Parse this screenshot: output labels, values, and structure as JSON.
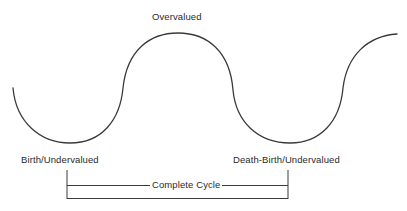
{
  "diagram": {
    "type": "cycle-curve",
    "colors": {
      "stroke": "#3a3a3a",
      "text": "#2a2a2a",
      "background": "#ffffff"
    },
    "labels": {
      "peak": "Overvalued",
      "start_trough": "Birth/Undervalued",
      "end_trough": "Death-Birth/Undervalued",
      "span": "Complete Cycle"
    },
    "curve_points": [
      {
        "x": 13,
        "y": 88,
        "role": "start"
      },
      {
        "x": 70,
        "y": 143,
        "role": "trough"
      },
      {
        "x": 123,
        "y": 88,
        "role": "inflection"
      },
      {
        "x": 178,
        "y": 33,
        "role": "peak"
      },
      {
        "x": 233,
        "y": 90,
        "role": "inflection"
      },
      {
        "x": 290,
        "y": 143,
        "role": "trough"
      },
      {
        "x": 343,
        "y": 88,
        "role": "inflection"
      },
      {
        "x": 397,
        "y": 34,
        "role": "end"
      }
    ],
    "bracket": {
      "left_x": 67,
      "right_x": 288,
      "top_y": 170,
      "mid_y": 185,
      "bottom_y": 198
    }
  }
}
